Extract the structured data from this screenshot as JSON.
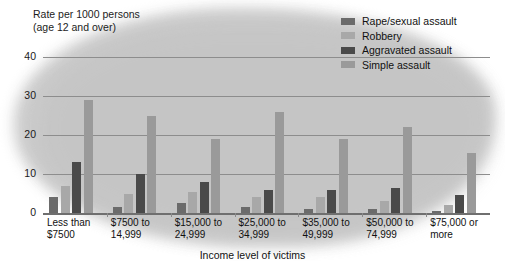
{
  "chart_data": {
    "type": "bar",
    "title": "",
    "ylabel": "Rate per 1000 persons (age 12 and over)",
    "ylabel_line1": "Rate per 1000 persons",
    "ylabel_line2": "(age 12 and over)",
    "xlabel": "Income level of victims",
    "ylim": [
      0,
      40
    ],
    "yticks": [
      0,
      10,
      20,
      30,
      40
    ],
    "ytick_labels": [
      "0",
      "10",
      "20",
      "30",
      "40"
    ],
    "grid": true,
    "legend_position": "top-right",
    "categories": [
      "Less than\n$7500",
      "$7500 to\n14,999",
      "$15,000 to\n24,999",
      "$25,000 to\n34,999",
      "$35,000 to\n49,999",
      "$50,000 to\n74,999",
      "$75,000 or\nmore"
    ],
    "category_lines": [
      [
        "Less than",
        "$7500"
      ],
      [
        "$7500 to",
        "14,999"
      ],
      [
        "$15,000 to",
        "24,999"
      ],
      [
        "$25,000 to",
        "34,999"
      ],
      [
        "$35,000 to",
        "49,999"
      ],
      [
        "$50,000 to",
        "74,999"
      ],
      [
        "$75,000 or",
        "more"
      ]
    ],
    "series": [
      {
        "name": "Rape/sexual assault",
        "color": "#6b6b6b",
        "values": [
          4.0,
          1.5,
          2.5,
          1.5,
          1.0,
          1.0,
          0.5
        ]
      },
      {
        "name": "Robbery",
        "color": "#a8a8a8",
        "values": [
          7.0,
          5.0,
          5.5,
          4.0,
          4.0,
          3.0,
          2.0
        ]
      },
      {
        "name": "Aggravated assault",
        "color": "#4a4a4a",
        "values": [
          13.0,
          10.0,
          8.0,
          6.0,
          6.0,
          6.5,
          4.5
        ]
      },
      {
        "name": "Simple assault",
        "color": "#9a9a9a",
        "values": [
          29.0,
          25.0,
          19.0,
          26.0,
          19.0,
          22.0,
          15.5
        ]
      }
    ]
  },
  "legend": {
    "items": [
      {
        "label": "Rape/sexual assault"
      },
      {
        "label": "Robbery"
      },
      {
        "label": "Aggravated assault"
      },
      {
        "label": "Simple assault"
      }
    ]
  }
}
